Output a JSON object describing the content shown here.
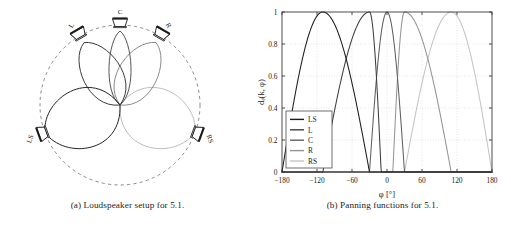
{
  "figure": {
    "subfigures": [
      {
        "id": "a",
        "caption": "(a) Loudspeaker setup for 5.1.",
        "type": "polar-diagram",
        "speakers": [
          {
            "label": "L",
            "angle_deg": -30
          },
          {
            "label": "C",
            "angle_deg": 0
          },
          {
            "label": "R",
            "angle_deg": 30
          },
          {
            "label": "LS",
            "angle_deg": -110
          },
          {
            "label": "RS",
            "angle_deg": 110
          }
        ],
        "lobes": [
          {
            "name": "LS",
            "angle_deg": -110,
            "shade": "#232323"
          },
          {
            "name": "L",
            "angle_deg": -30,
            "shade": "#3b3b3b"
          },
          {
            "name": "C",
            "angle_deg": 0,
            "shade": "#555555"
          },
          {
            "name": "R",
            "angle_deg": 30,
            "shade": "#8a8a8a"
          },
          {
            "name": "RS",
            "angle_deg": 110,
            "shade": "#bdbdbd"
          }
        ],
        "guide_circle": "dashed"
      },
      {
        "id": "b",
        "caption": "(b) Panning functions for 5.1."
      }
    ]
  },
  "chart_data": {
    "type": "line",
    "title": "",
    "xlabel": "φ [°]",
    "ylabel": "dₑ(k, φ)",
    "xlim": [
      -180,
      180
    ],
    "ylim": [
      0,
      1
    ],
    "xticks": [
      -180,
      -120,
      -60,
      0,
      60,
      120,
      180
    ],
    "xticklabels": [
      "−180",
      "−120",
      "−60",
      "0",
      "60",
      "120",
      "180"
    ],
    "yticks": [
      0,
      0.2,
      0.4,
      0.6,
      0.8,
      1
    ],
    "yticklabels": [
      "0",
      "0.2",
      "0.4",
      "0.6",
      "0.8",
      "1"
    ],
    "grid": true,
    "legend_position": "lower-left",
    "legend": [
      "LS",
      "L",
      "C",
      "R",
      "RS"
    ],
    "colors": {
      "LS": "#1c1c1c",
      "L": "#3d3d3d",
      "C": "#606060",
      "R": "#949494",
      "RS": "#c4c4c4"
    },
    "series": [
      {
        "name": "LS",
        "color": "#1c1c1c",
        "peak_deg": -110,
        "zero_left_deg": -180,
        "zero_right_deg": -30,
        "wrap": true,
        "x": [
          -180,
          -170,
          -160,
          -150,
          -140,
          -130,
          -120,
          -110,
          -100,
          -90,
          -80,
          -70,
          -60,
          -50,
          -40,
          -30,
          -20,
          0,
          20,
          30,
          40,
          60,
          80,
          100,
          110,
          120,
          140,
          160,
          180
        ],
        "y": [
          0.707,
          0.793,
          0.867,
          0.924,
          0.966,
          0.991,
          1.0,
          1.0,
          0.985,
          0.943,
          0.876,
          0.786,
          0.676,
          0.548,
          0.407,
          0.0,
          0.0,
          0.0,
          0.0,
          0.0,
          0.0,
          0.0,
          0.0,
          0.0,
          0.0,
          0.0,
          0.174,
          0.423,
          0.707
        ]
      },
      {
        "name": "L",
        "color": "#3d3d3d",
        "peak_deg": -30,
        "zero_left_deg": -110,
        "zero_right_deg": -10,
        "x": [
          -180,
          -120,
          -110,
          -100,
          -90,
          -80,
          -70,
          -60,
          -50,
          -40,
          -30,
          -25,
          -20,
          -15,
          -10,
          0,
          60,
          120,
          180
        ],
        "y": [
          0.0,
          0.0,
          0.0,
          0.195,
          0.383,
          0.556,
          0.707,
          0.831,
          0.924,
          0.981,
          1.0,
          0.989,
          0.924,
          0.793,
          0.0,
          0.0,
          0.0,
          0.0,
          0.0
        ]
      },
      {
        "name": "C",
        "color": "#606060",
        "peak_deg": 0,
        "zero_left_deg": -30,
        "zero_right_deg": 30,
        "x": [
          -180,
          -60,
          -30,
          -25,
          -20,
          -15,
          -10,
          -5,
          0,
          5,
          10,
          15,
          20,
          25,
          30,
          60,
          180
        ],
        "y": [
          0.0,
          0.0,
          0.0,
          0.259,
          0.5,
          0.707,
          0.866,
          0.966,
          1.0,
          0.966,
          0.866,
          0.707,
          0.5,
          0.259,
          0.0,
          0.0,
          0.0
        ]
      },
      {
        "name": "R",
        "color": "#949494",
        "peak_deg": 30,
        "zero_left_deg": 10,
        "zero_right_deg": 110,
        "x": [
          -180,
          -60,
          0,
          10,
          15,
          20,
          25,
          30,
          40,
          50,
          60,
          70,
          80,
          90,
          100,
          110,
          120,
          180
        ],
        "y": [
          0.0,
          0.0,
          0.0,
          0.0,
          0.793,
          0.924,
          0.989,
          1.0,
          0.981,
          0.924,
          0.831,
          0.707,
          0.556,
          0.383,
          0.195,
          0.0,
          0.0,
          0.0
        ]
      },
      {
        "name": "RS",
        "color": "#c4c4c4",
        "peak_deg": 110,
        "zero_left_deg": 30,
        "zero_right_deg": 180,
        "wrap": true,
        "x": [
          -180,
          -160,
          -140,
          -120,
          -110,
          -60,
          0,
          30,
          40,
          50,
          60,
          70,
          80,
          90,
          100,
          110,
          120,
          130,
          140,
          150,
          160,
          170,
          180
        ],
        "y": [
          0.707,
          0.423,
          0.174,
          0.0,
          0.0,
          0.0,
          0.0,
          0.0,
          0.407,
          0.548,
          0.676,
          0.786,
          0.876,
          0.943,
          0.985,
          1.0,
          1.0,
          0.991,
          0.966,
          0.924,
          0.867,
          0.793,
          0.707
        ]
      }
    ]
  }
}
